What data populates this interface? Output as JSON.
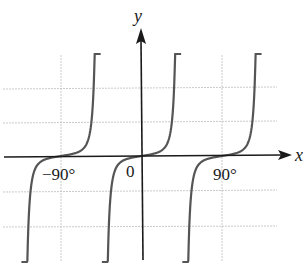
{
  "chart_data": {
    "type": "line",
    "title": "",
    "xlabel": "x",
    "ylabel": "y",
    "x_tick_labels": [
      "−90°",
      "0",
      "90°"
    ],
    "x_ticks_deg": [
      -90,
      0,
      90
    ],
    "xlim_deg": [
      -135,
      135
    ],
    "grid": true,
    "series": [
      {
        "name": "y = f(x)",
        "period_deg": 90,
        "zeros_deg": [
          -90,
          0,
          90
        ],
        "asymptotes_deg": [
          -135,
          -45,
          45,
          135
        ]
      }
    ]
  },
  "labels": {
    "x_axis": "x",
    "y_axis": "y",
    "tick_neg90": "−90°",
    "tick_0": "0",
    "tick_90": "90°"
  }
}
